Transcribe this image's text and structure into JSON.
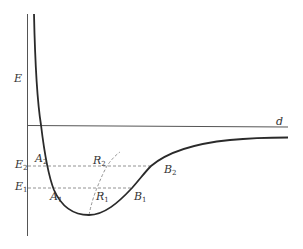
{
  "diagram": {
    "type": "potential-energy-curve",
    "axes": {
      "y_label": "E",
      "x_label": "d"
    },
    "energy_levels": [
      {
        "label": "E",
        "sub": "2",
        "left_point": {
          "label": "A",
          "sub": "2"
        },
        "right_point": {
          "label": "B",
          "sub": "2"
        },
        "mid_point": {
          "label": "R",
          "sub": "2"
        }
      },
      {
        "label": "E",
        "sub": "1",
        "left_point": {
          "label": "A",
          "sub": "1"
        },
        "right_point": {
          "label": "B",
          "sub": "1"
        },
        "mid_point": {
          "label": "R",
          "sub": "1"
        }
      }
    ],
    "colors": {
      "curve": "#2a2a2a",
      "axis": "#555555",
      "dashed": "#777777"
    }
  }
}
